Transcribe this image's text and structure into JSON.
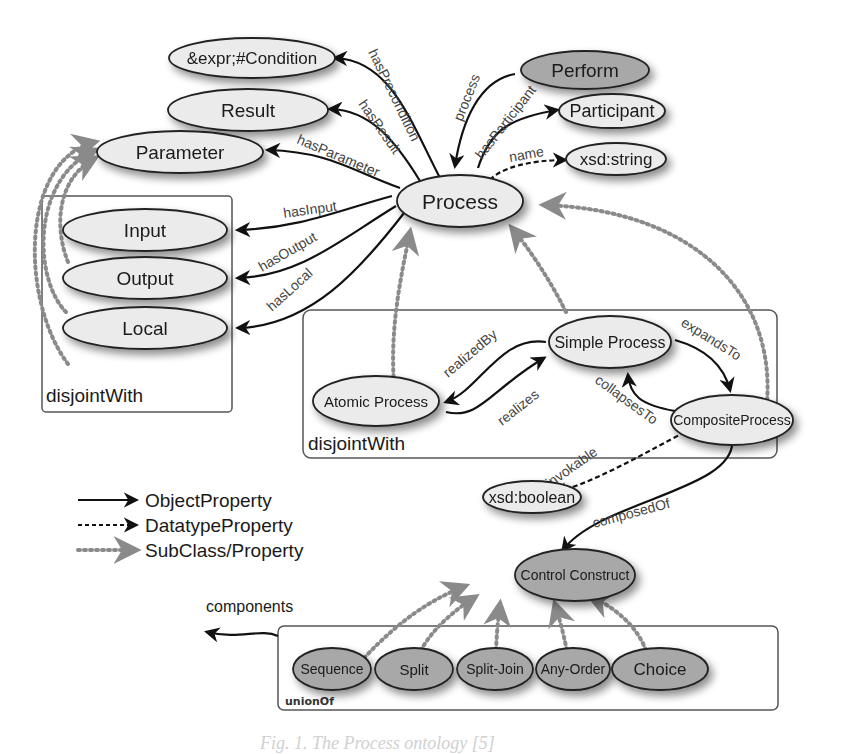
{
  "nodes": {
    "condition": {
      "label": "&expr;#Condition",
      "shaded": false
    },
    "result": {
      "label": "Result",
      "shaded": false
    },
    "parameter": {
      "label": "Parameter",
      "shaded": false
    },
    "input": {
      "label": "Input",
      "shaded": false
    },
    "output": {
      "label": "Output",
      "shaded": false
    },
    "local": {
      "label": "Local",
      "shaded": false
    },
    "process": {
      "label": "Process",
      "shaded": false
    },
    "perform": {
      "label": "Perform",
      "shaded": true
    },
    "participant": {
      "label": "Participant",
      "shaded": false
    },
    "xsd_string": {
      "label": "xsd:string",
      "shaded": false
    },
    "simple_process": {
      "label": "Simple Process",
      "shaded": false
    },
    "atomic_process": {
      "label": "Atomic Process",
      "shaded": false
    },
    "composite_process": {
      "label": "CompositeProcess",
      "shaded": false
    },
    "xsd_boolean": {
      "label": "xsd:boolean",
      "shaded": false
    },
    "control_construct": {
      "label": "Control Construct",
      "shaded": true
    },
    "sequence": {
      "label": "Sequence",
      "shaded": true
    },
    "split": {
      "label": "Split",
      "shaded": true
    },
    "split_join": {
      "label": "Split-Join",
      "shaded": true
    },
    "any_order": {
      "label": "Any-Order",
      "shaded": true
    },
    "choice": {
      "label": "Choice",
      "shaded": true
    }
  },
  "edges": {
    "hasPrecondition": "hasPrecondition",
    "hasResult": "hasResult",
    "hasParameter": "hasParameter",
    "hasInput": "hasInput",
    "hasOutput": "hasOutput",
    "hasLocal": "hasLocal",
    "process": "process",
    "hasParticipant": "hasParticipant",
    "name": "name",
    "realizedBy": "realizedBy",
    "realizes": "realizes",
    "expandsTo": "expandsTo",
    "collapsesTo": "collapsesTo",
    "invokable": "invokable",
    "composedOf": "composedOf",
    "components": "components"
  },
  "groups": {
    "params_group": "disjointWith",
    "process_group": "disjointWith",
    "construct_group": "unionOf"
  },
  "legend": {
    "object_property": "ObjectProperty",
    "datatype_property": "DatatypeProperty",
    "subclass_property": "SubClass/Property"
  },
  "colors": {
    "node_fill": "#ebebeb",
    "node_shaded_fill": "#a8a8a8",
    "stroke": "#222222",
    "subclass_arrow": "#8a8a8a"
  },
  "caption": "Fig. 1. The Process ontology [5]"
}
